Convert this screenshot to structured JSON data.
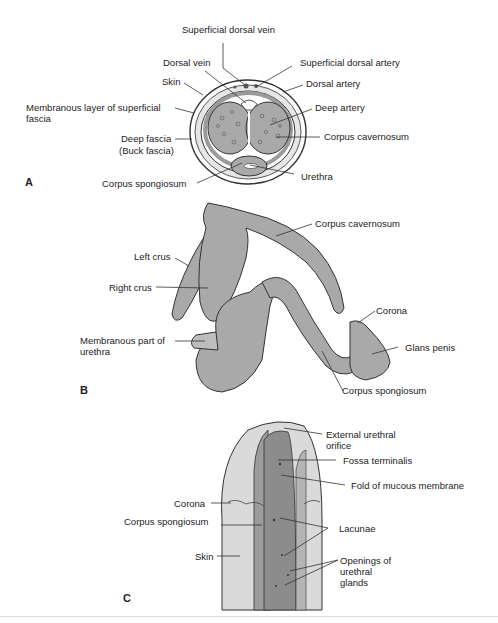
{
  "figure": {
    "colors": {
      "tissue_fill": "#a9a9a9",
      "tissue_light": "#d9d9d9",
      "mucosa_dark": "#8c8c8c",
      "outline": "#333333",
      "background": "#ffffff"
    },
    "panels": [
      {
        "letter": "A",
        "view": "cross-section",
        "labels": [
          "Superficial dorsal vein",
          "Dorsal vein",
          "Superficial dorsal artery",
          "Skin",
          "Dorsal artery",
          "Membranous layer of superficial fascia",
          "Deep artery",
          "Corpus cavernosum",
          "Deep fascia (Buck fascia)",
          "Urethra",
          "Corpus spongiosum"
        ]
      },
      {
        "letter": "B",
        "view": "erectile bodies",
        "labels": [
          "Corpus cavernosum",
          "Left crus",
          "Right crus",
          "Corona",
          "Membranous part of urethra",
          "Glans penis",
          "Corpus spongiosum"
        ]
      },
      {
        "letter": "C",
        "view": "opened urethra",
        "labels": [
          "External urethral orifice",
          "Fossa terminalis",
          "Fold of mucous membrane",
          "Corona",
          "Corpus spongiosum",
          "Lacunae",
          "Skin",
          "Openings of urethral glands"
        ]
      }
    ]
  },
  "panelA": {
    "letter": "A",
    "superficial_dorsal_vein": "Superficial dorsal vein",
    "dorsal_vein": "Dorsal vein",
    "superficial_dorsal_artery": "Superficial dorsal artery",
    "skin": "Skin",
    "dorsal_artery": "Dorsal artery",
    "membranous_layer_1": "Membranous layer of superficial",
    "membranous_layer_2": "fascia",
    "deep_artery": "Deep artery",
    "corpus_cavernosum": "Corpus cavernosum",
    "deep_fascia_1": "Deep fascia",
    "deep_fascia_2": "(Buck fascia)",
    "urethra": "Urethra",
    "corpus_spongiosum": "Corpus spongiosum"
  },
  "panelB": {
    "letter": "B",
    "corpus_cavernosum": "Corpus cavernosum",
    "left_crus": "Left crus",
    "right_crus": "Right crus",
    "corona": "Corona",
    "membranous_part_1": "Membranous part of",
    "membranous_part_2": "urethra",
    "glans_penis": "Glans penis",
    "corpus_spongiosum": "Corpus spongiosum"
  },
  "panelC": {
    "letter": "C",
    "external_orifice_1": "External urethral",
    "external_orifice_2": "orifice",
    "fossa_terminalis": "Fossa terminalis",
    "fold_mucous": "Fold of mucous membrane",
    "corona": "Corona",
    "corpus_spongiosum": "Corpus spongiosum",
    "lacunae": "Lacunae",
    "skin": "Skin",
    "openings_1": "Openings of",
    "openings_2": "urethral",
    "openings_3": "glands"
  }
}
